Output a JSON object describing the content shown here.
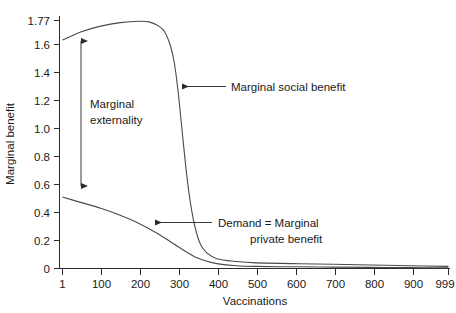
{
  "chart_data": {
    "type": "line",
    "title": "",
    "xlabel": "Vaccinations",
    "ylabel": "Marginal benefit",
    "xlim": [
      1,
      999
    ],
    "ylim": [
      0,
      1.77
    ],
    "grid": false,
    "legend": "none",
    "xticks": [
      "1",
      "100",
      "200",
      "300",
      "400",
      "500",
      "600",
      "700",
      "800",
      "900",
      "999"
    ],
    "xtick_values": [
      1,
      100,
      200,
      300,
      400,
      500,
      600,
      700,
      800,
      900,
      999
    ],
    "yticks": [
      "0",
      "0.2",
      "0.4",
      "0.6",
      "0.8",
      "1.0",
      "1.2",
      "1.4",
      "1.6",
      "1.77"
    ],
    "ytick_values": [
      0,
      0.2,
      0.4,
      0.6,
      0.8,
      1.0,
      1.2,
      1.4,
      1.6,
      1.77
    ],
    "series": [
      {
        "name": "Marginal social benefit",
        "x": [
          1,
          50,
          100,
          150,
          200,
          225,
          250,
          265,
          280,
          290,
          300,
          310,
          320,
          330,
          340,
          350,
          360,
          375,
          400,
          450,
          500,
          600,
          700,
          800,
          900,
          999
        ],
        "values": [
          1.63,
          1.69,
          1.73,
          1.755,
          1.765,
          1.76,
          1.73,
          1.69,
          1.59,
          1.47,
          1.26,
          0.99,
          0.72,
          0.5,
          0.34,
          0.23,
          0.16,
          0.11,
          0.07,
          0.05,
          0.04,
          0.035,
          0.03,
          0.025,
          0.02,
          0.015
        ]
      },
      {
        "name": "Demand = Marginal private benefit",
        "x": [
          1,
          50,
          100,
          150,
          200,
          250,
          300,
          350,
          400,
          450,
          500,
          600,
          700,
          800,
          900,
          999
        ],
        "values": [
          0.51,
          0.47,
          0.43,
          0.38,
          0.32,
          0.245,
          0.155,
          0.075,
          0.035,
          0.02,
          0.015,
          0.012,
          0.01,
          0.008,
          0.006,
          0.005
        ]
      }
    ],
    "annotations": [
      {
        "id": "marginal-externality",
        "text_line_1": "Marginal",
        "text_line_2": "externality",
        "arrow": "double-vertical",
        "at_x": 55,
        "from_y": 0.51,
        "to_y": 1.65
      },
      {
        "id": "marginal-social-benefit",
        "text": "Marginal social benefit",
        "arrow": "left",
        "points_to_x": 320,
        "points_to_y": 1.25
      },
      {
        "id": "demand-marginal-private-benefit",
        "text_line_1": "Demand = Marginal",
        "text_line_2": "private benefit",
        "arrow": "left",
        "points_to_x": 230,
        "points_to_y": 0.28
      }
    ]
  },
  "colors": {
    "curve": "#4a4a4a",
    "axis": "#2b2b2b",
    "text": "#1a1a1a",
    "background": "#ffffff"
  },
  "labels": {
    "xaxis_title": "Vaccinations",
    "yaxis_title": "Marginal benefit",
    "msb_label": "Marginal social benefit",
    "externality_line1": "Marginal",
    "externality_line2": "externality",
    "demand_line1": "Demand = Marginal",
    "demand_line2": "private benefit",
    "ytick_0": "0",
    "ytick_1": "0.2",
    "ytick_2": "0.4",
    "ytick_3": "0.6",
    "ytick_4": "0.8",
    "ytick_5": "1.0",
    "ytick_6": "1.2",
    "ytick_7": "1.4",
    "ytick_8": "1.6",
    "ytick_9": "1.77",
    "xtick_0": "1",
    "xtick_1": "100",
    "xtick_2": "200",
    "xtick_3": "300",
    "xtick_4": "400",
    "xtick_5": "500",
    "xtick_6": "600",
    "xtick_7": "700",
    "xtick_8": "800",
    "xtick_9": "900",
    "xtick_10": "999"
  }
}
